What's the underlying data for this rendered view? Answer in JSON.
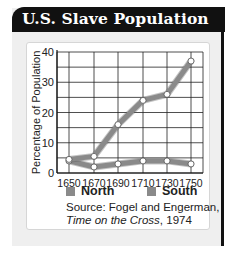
{
  "header": {
    "title": "U.S. Slave Population"
  },
  "chart_data": {
    "type": "line",
    "title": "U.S. Slave Population",
    "xlabel": "",
    "ylabel": "Percentage of Population",
    "x": [
      1650,
      1670,
      1690,
      1710,
      1730,
      1750
    ],
    "x_tick_labels": [
      "1650",
      "1670",
      "1690",
      "1710",
      "1730",
      "1750"
    ],
    "y_tick_labels": [
      "0",
      "10",
      "20",
      "30",
      "40"
    ],
    "ylim": [
      0,
      40
    ],
    "grid": true,
    "legend_position": "bottom",
    "series": [
      {
        "name": "North",
        "values": [
          4,
          2,
          3,
          4,
          4,
          3
        ],
        "color": "#8a8a8a"
      },
      {
        "name": "South",
        "values": [
          4.5,
          5.5,
          16,
          24,
          26,
          37
        ],
        "color": "#8a8a8a"
      }
    ]
  },
  "legend": {
    "north": "North",
    "south": "South"
  },
  "source": {
    "prefix": "Source: Fogel and Engerman,",
    "book": "Time on the Cross",
    "year": ", 1974"
  },
  "colors": {
    "header_bg": "#111111",
    "panel_bg": "#efefef",
    "line": "#8a8a8a",
    "grid": "#222222"
  }
}
